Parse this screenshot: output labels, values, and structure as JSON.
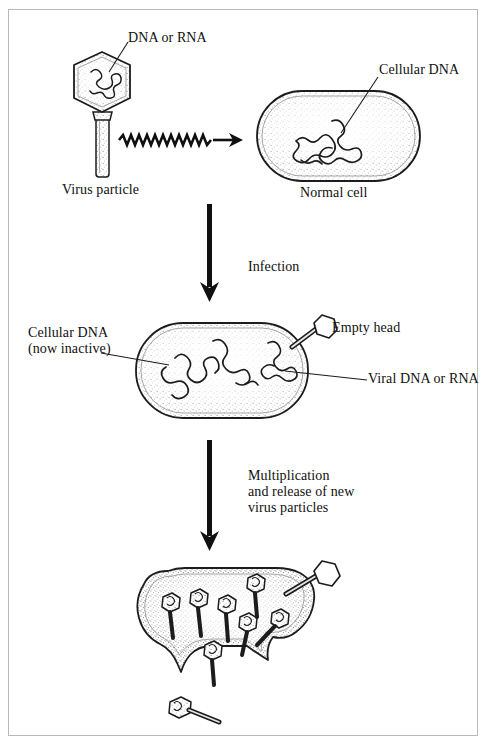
{
  "figure": {
    "type": "biological-process-diagram",
    "background_color": "#ffffff",
    "frame_color": "#b9b9b9",
    "ink_color": "#101010"
  },
  "labels": {
    "dna_or_rna": "DNA or RNA",
    "virus_particle": "Virus particle",
    "cellular_dna": "Cellular DNA",
    "normal_cell": "Normal cell",
    "cellular_dna_inactive": "Cellular DNA\n(now inactive)",
    "empty_head": "Empty head",
    "viral_dna_or_rna": "Viral DNA or RNA",
    "infection": "Infection",
    "multiplication": "Multiplication\nand release of new\nvirus particles"
  },
  "stages": [
    {
      "id": "stage-1",
      "name": "attachment",
      "elements": [
        "virus-particle",
        "normal-cell"
      ],
      "step_label": "Infection"
    },
    {
      "id": "stage-2",
      "name": "injection",
      "elements": [
        "infected-cell",
        "empty-head-virus"
      ],
      "step_label": "Multiplication\nand release of new\nvirus particles"
    },
    {
      "id": "stage-3",
      "name": "lysis-and-release",
      "elements": [
        "lysing-cell",
        "progeny-virions",
        "released-virion"
      ]
    }
  ],
  "counts": {
    "progeny_virions_inside": 7,
    "virions_escaping": 1,
    "released_virions_outside": 1
  },
  "arrows": {
    "wavy_arrow_direction": "right",
    "infection_arrow_direction": "down",
    "multiplication_arrow_direction": "down"
  }
}
